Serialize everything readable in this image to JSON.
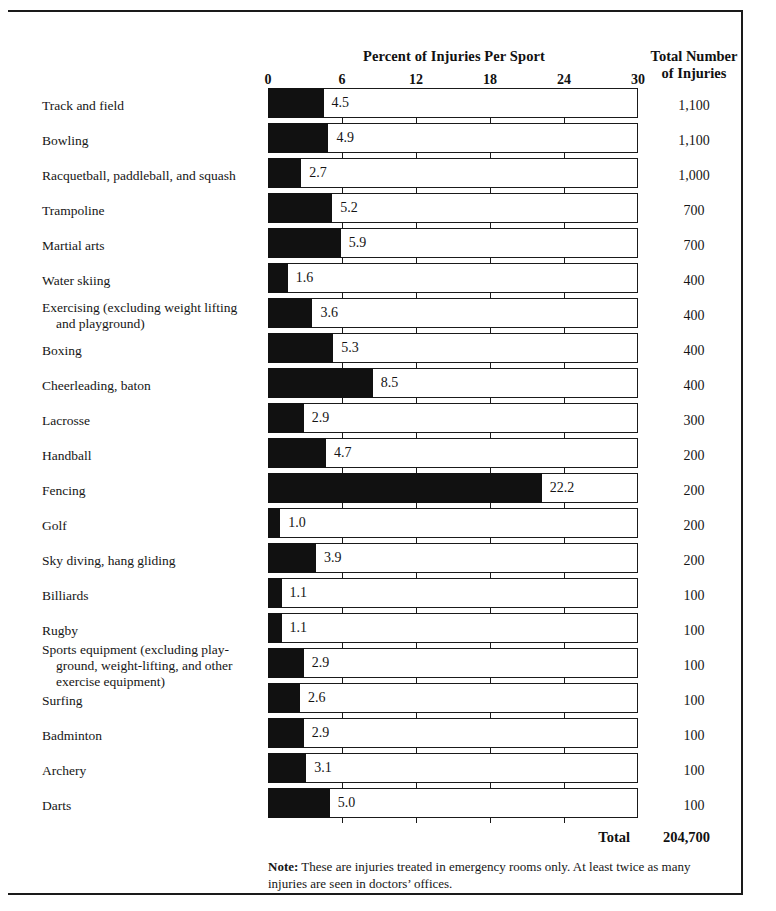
{
  "chart_data": {
    "type": "bar",
    "title": "Percent of Injuries Per Sport",
    "secondary_column_header": "Total Number of Injuries",
    "xlabel": "",
    "ylabel": "",
    "xlim": [
      0,
      30
    ],
    "xticks": [
      0,
      6,
      12,
      18,
      24,
      30
    ],
    "xtick_labels": [
      "0",
      "6",
      "12",
      "18",
      "24",
      "30"
    ],
    "grid": false,
    "legend": "none",
    "orientation": "horizontal",
    "categories": [
      "Track and field",
      "Bowling",
      "Racquetball, paddleball, and squash",
      "Trampoline",
      "Martial arts",
      "Water skiing",
      "Exercising (excluding weight lifting and playground)",
      "Boxing",
      "Cheerleading, baton",
      "Lacrosse",
      "Handball",
      "Fencing",
      "Golf",
      "Sky diving, hang gliding",
      "Billiards",
      "Rugby",
      "Sports equipment (excluding playground, weight-lifting, and other exercise equipment)",
      "Surfing",
      "Badminton",
      "Archery",
      "Darts"
    ],
    "values": [
      4.5,
      4.9,
      2.7,
      5.2,
      5.9,
      1.6,
      3.6,
      5.3,
      8.5,
      2.9,
      4.7,
      22.2,
      1.0,
      3.9,
      1.1,
      1.1,
      2.9,
      2.6,
      2.9,
      3.1,
      5.0
    ],
    "value_labels": [
      "4.5",
      "4.9",
      "2.7",
      "5.2",
      "5.9",
      "1.6",
      "3.6",
      "5.3",
      "8.5",
      "2.9",
      "4.7",
      "22.2",
      "1.0",
      "3.9",
      "1.1",
      "1.1",
      "2.9",
      "2.6",
      "2.9",
      "3.1",
      "5.0"
    ],
    "totals": [
      "1,100",
      "1,100",
      "1,000",
      "700",
      "700",
      "400",
      "400",
      "400",
      "400",
      "300",
      "200",
      "200",
      "200",
      "200",
      "100",
      "100",
      "100",
      "100",
      "100",
      "100",
      "100"
    ],
    "total_row_label": "Total",
    "total_row_value": "204,700",
    "bar_color": "#111111",
    "bar_outline_color": "#1a1a1a",
    "background_color": "#ffffff"
  },
  "category_label_lines": [
    [
      "Track and field"
    ],
    [
      "Bowling"
    ],
    [
      "Racquetball, paddleball, and squash"
    ],
    [
      "Trampoline"
    ],
    [
      "Martial arts"
    ],
    [
      "Water skiing"
    ],
    [
      "Exercising (excluding weight  lifting",
      "and playground)"
    ],
    [
      "Boxing"
    ],
    [
      "Cheerleading, baton"
    ],
    [
      "Lacrosse"
    ],
    [
      "Handball"
    ],
    [
      "Fencing"
    ],
    [
      "Golf"
    ],
    [
      "Sky diving, hang gliding"
    ],
    [
      "Billiards"
    ],
    [
      "Rugby"
    ],
    [
      "Sports equipment (excluding play-",
      "ground, weight-lifting, and other",
      "exercise equipment)"
    ],
    [
      "Surfing"
    ],
    [
      "Badminton"
    ],
    [
      "Archery"
    ],
    [
      "Darts"
    ]
  ],
  "header": {
    "chart_title": "Percent of Injuries Per Sport",
    "totals_title_line1": "Total Number",
    "totals_title_line2": "of Injuries"
  },
  "note": {
    "prefix": "Note:",
    "text": " These are injuries treated in emergency rooms only. At least twice as many injuries are seen in doctors’ offices."
  }
}
